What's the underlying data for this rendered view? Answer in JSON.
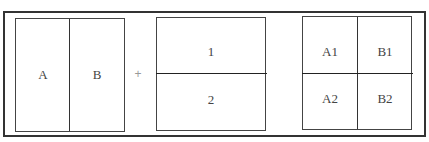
{
  "diagram": {
    "panel_vertical": {
      "left_label": "A",
      "right_label": "B"
    },
    "operator": "+",
    "panel_horizontal": {
      "top_label": "1",
      "bottom_label": "2"
    },
    "panel_grid": {
      "top_left": "A1",
      "top_right": "B1",
      "bottom_left": "A2",
      "bottom_right": "B2"
    }
  },
  "colors": {
    "border": "#333333",
    "text": "#444444",
    "operator": "#999999",
    "background": "#ffffff"
  }
}
